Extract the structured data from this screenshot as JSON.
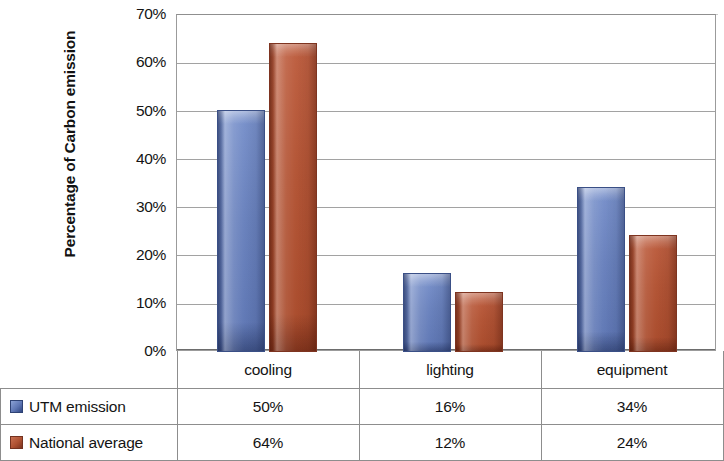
{
  "chart_data": {
    "type": "bar",
    "title": "",
    "xlabel": "",
    "ylabel": "Percentage of Carbon emission",
    "categories": [
      "cooling",
      "lighting",
      "equipment"
    ],
    "series": [
      {
        "name": "UTM emission",
        "color": "#6b83be",
        "values": [
          50,
          16,
          34
        ],
        "labels": [
          "50%",
          "16%",
          "34%"
        ]
      },
      {
        "name": "National average",
        "color": "#b35536",
        "values": [
          64,
          12,
          24
        ],
        "labels": [
          "64%",
          "12%",
          "24%"
        ]
      }
    ],
    "ylim": [
      0,
      70
    ],
    "ytick_step": 10,
    "ytick_labels": [
      "70%",
      "60%",
      "50%",
      "40%",
      "30%",
      "20%",
      "10%",
      "0%"
    ],
    "ytick_values": [
      70,
      60,
      50,
      40,
      30,
      20,
      10,
      0
    ],
    "grid": true,
    "legend_position": "bottom-table",
    "value_format": "percent"
  },
  "axis": {
    "y_title": "Percentage of Carbon emission"
  },
  "table": {
    "category_row": [
      "cooling",
      "lighting",
      "equipment"
    ],
    "rows": [
      {
        "label": "UTM emission",
        "swatch": "blue-swatch",
        "cells": [
          "50%",
          "16%",
          "34%"
        ]
      },
      {
        "label": "National average",
        "swatch": "red-swatch",
        "cells": [
          "64%",
          "12%",
          "24%"
        ]
      }
    ]
  },
  "colors": {
    "series_blue": "#6b83be",
    "series_red": "#b35536",
    "gridline": "#a2a2a2",
    "border": "#8d8d8d"
  }
}
